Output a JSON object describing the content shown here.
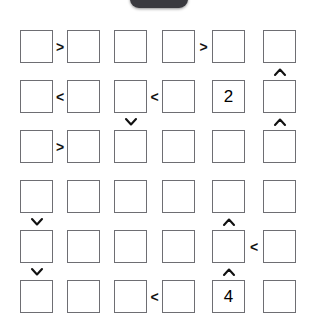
{
  "overlay": {
    "top_tab": {
      "name": "top-pill",
      "color": "#3a3a3f"
    }
  },
  "puzzle": {
    "type": "inequality-grid",
    "rows": 6,
    "cols": 6,
    "cell_size": 33,
    "col_x": [
      20,
      67,
      114,
      162,
      212,
      263
    ],
    "row_y": [
      30,
      80,
      130,
      180,
      230,
      280
    ],
    "grid_values": [
      [
        "",
        "",
        "",
        "",
        "",
        ""
      ],
      [
        "",
        "",
        "",
        "",
        "2",
        ""
      ],
      [
        "",
        "",
        "",
        "",
        "",
        ""
      ],
      [
        "",
        "",
        "",
        "",
        "",
        ""
      ],
      [
        "",
        "",
        "",
        "",
        "",
        ""
      ],
      [
        "",
        "",
        "",
        "",
        "4",
        ""
      ]
    ],
    "horizontal_signs": [
      {
        "row": 1,
        "left_col": 1,
        "sign": ">"
      },
      {
        "row": 1,
        "left_col": 4,
        "sign": ">"
      },
      {
        "row": 2,
        "left_col": 1,
        "sign": "<"
      },
      {
        "row": 2,
        "left_col": 3,
        "sign": "<"
      },
      {
        "row": 3,
        "left_col": 1,
        "sign": ">"
      },
      {
        "row": 5,
        "left_col": 5,
        "sign": "<"
      },
      {
        "row": 6,
        "left_col": 3,
        "sign": "<"
      }
    ],
    "vertical_signs": [
      {
        "col": 6,
        "top_row": 1,
        "sign": "^"
      },
      {
        "col": 3,
        "top_row": 2,
        "sign": "v"
      },
      {
        "col": 6,
        "top_row": 2,
        "sign": "^"
      },
      {
        "col": 1,
        "top_row": 4,
        "sign": "v"
      },
      {
        "col": 5,
        "top_row": 4,
        "sign": "^"
      },
      {
        "col": 1,
        "top_row": 5,
        "sign": "v"
      },
      {
        "col": 5,
        "top_row": 5,
        "sign": "^"
      }
    ]
  }
}
